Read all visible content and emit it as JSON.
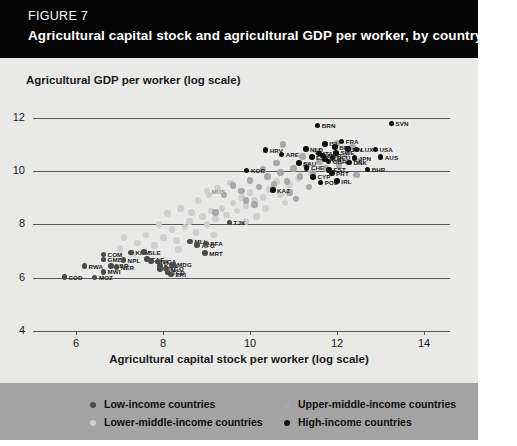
{
  "figure": {
    "number": "FIGURE 7",
    "title": "Agricultural capital stock and agricultural GDP per worker, by country"
  },
  "colors": {
    "header_bg": "#050505",
    "figure_bg": "#e9e9e7",
    "legend_bg": "#a3a3a3",
    "low_income": "#4a4a4a",
    "lower_middle_income": "#cfcfcf",
    "upper_middle_income": "#a8a8a8",
    "high_income": "#111111",
    "gridline": "#595959"
  },
  "legend": {
    "items": [
      {
        "label": "Low-income countries",
        "marker": "#4a4a4a"
      },
      {
        "label": "Lower-middle-income countries",
        "marker": "#cfcfcf"
      },
      {
        "label": "Upper-middle-income countries",
        "marker": "#a8a8a8"
      },
      {
        "label": "High-income countries",
        "marker": "#111111"
      }
    ]
  },
  "chart_data": {
    "type": "scatter",
    "title": "Agricultural capital stock and agricultural GDP per worker, by country",
    "xlabel": "Agricultural capital stock per worker (log scale)",
    "ylabel": "Agricultural GDP per worker (log scale)",
    "xlim": [
      5,
      14.6
    ],
    "ylim": [
      4,
      12.4
    ],
    "xticks": [
      6,
      8,
      10,
      12,
      14
    ],
    "yticks": [
      4,
      6,
      8,
      10,
      12
    ],
    "grid": true,
    "legend_position": "bottom",
    "series": [
      {
        "name": "Low-income countries",
        "color": "#4a4a4a",
        "points": [
          {
            "label": "COD",
            "x": 5.72,
            "y": 6.02
          },
          {
            "label": "MOZ",
            "x": 6.42,
            "y": 6.0
          },
          {
            "label": "RWA",
            "x": 6.18,
            "y": 6.43
          },
          {
            "label": "GMB",
            "x": 6.62,
            "y": 6.68
          },
          {
            "label": "COM",
            "x": 6.62,
            "y": 6.86
          },
          {
            "label": "LBR",
            "x": 6.8,
            "y": 6.44
          },
          {
            "label": "MWI",
            "x": 6.62,
            "y": 6.22
          },
          {
            "label": "NER",
            "x": 6.92,
            "y": 6.4
          },
          {
            "label": "KHM",
            "x": 7.26,
            "y": 6.95
          },
          {
            "label": "NPL",
            "x": 7.08,
            "y": 6.66
          },
          {
            "label": "SLE",
            "x": 7.56,
            "y": 6.96
          },
          {
            "label": "CAF",
            "x": 7.62,
            "y": 6.7
          },
          {
            "label": "ETH",
            "x": 7.72,
            "y": 6.62
          },
          {
            "label": "UGA",
            "x": 7.88,
            "y": 6.6
          },
          {
            "label": "KEN",
            "x": 7.92,
            "y": 6.46
          },
          {
            "label": "GIN",
            "x": 7.92,
            "y": 6.32
          },
          {
            "label": "TGO",
            "x": 8.06,
            "y": 6.34
          },
          {
            "label": "MDG",
            "x": 8.22,
            "y": 6.48
          },
          {
            "label": "TCD",
            "x": 8.1,
            "y": 6.2
          },
          {
            "label": "ERI",
            "x": 8.18,
            "y": 6.12
          },
          {
            "label": "MLI",
            "x": 8.62,
            "y": 7.36
          },
          {
            "label": "AFG",
            "x": 8.78,
            "y": 7.22
          },
          {
            "label": "BFA",
            "x": 8.98,
            "y": 7.28
          },
          {
            "label": "MRT",
            "x": 8.96,
            "y": 6.92
          },
          {
            "label": "TJK",
            "x": 9.52,
            "y": 8.06
          }
        ]
      },
      {
        "name": "Lower-middle-income countries",
        "color": "#cfcfcf",
        "points": [
          {
            "label": "",
            "x": 7.1,
            "y": 7.5
          },
          {
            "label": "",
            "x": 7.4,
            "y": 7.3
          },
          {
            "label": "",
            "x": 7.6,
            "y": 7.6
          },
          {
            "label": "",
            "x": 7.8,
            "y": 7.2
          },
          {
            "label": "",
            "x": 8.0,
            "y": 7.5
          },
          {
            "label": "",
            "x": 8.2,
            "y": 7.8
          },
          {
            "label": "",
            "x": 8.3,
            "y": 7.4
          },
          {
            "label": "",
            "x": 8.5,
            "y": 7.9
          },
          {
            "label": "",
            "x": 8.6,
            "y": 8.1
          },
          {
            "label": "",
            "x": 8.75,
            "y": 7.7
          },
          {
            "label": "",
            "x": 8.9,
            "y": 8.3
          },
          {
            "label": "",
            "x": 9.0,
            "y": 8.0
          },
          {
            "label": "",
            "x": 9.1,
            "y": 8.5
          },
          {
            "label": "",
            "x": 9.2,
            "y": 8.2
          },
          {
            "label": "",
            "x": 9.35,
            "y": 8.6
          },
          {
            "label": "",
            "x": 9.45,
            "y": 8.35
          },
          {
            "label": "",
            "x": 9.6,
            "y": 8.8
          },
          {
            "label": "",
            "x": 9.7,
            "y": 8.5
          },
          {
            "label": "",
            "x": 9.8,
            "y": 9.0
          },
          {
            "label": "",
            "x": 9.9,
            "y": 8.7
          },
          {
            "label": "",
            "x": 10.0,
            "y": 9.2
          },
          {
            "label": "",
            "x": 10.1,
            "y": 8.9
          },
          {
            "label": "",
            "x": 10.2,
            "y": 9.4
          },
          {
            "label": "",
            "x": 10.3,
            "y": 9.0
          },
          {
            "label": "",
            "x": 10.45,
            "y": 9.3
          },
          {
            "label": "",
            "x": 10.6,
            "y": 9.6
          },
          {
            "label": "",
            "x": 10.7,
            "y": 9.1
          },
          {
            "label": "",
            "x": 8.1,
            "y": 8.4
          },
          {
            "label": "",
            "x": 8.4,
            "y": 8.6
          },
          {
            "label": "",
            "x": 8.8,
            "y": 8.9
          },
          {
            "label": "",
            "x": 9.05,
            "y": 9.1
          },
          {
            "label": "",
            "x": 9.25,
            "y": 9.35
          },
          {
            "label": "",
            "x": 7.9,
            "y": 8.0
          },
          {
            "label": "",
            "x": 8.65,
            "y": 8.45
          },
          {
            "label": "",
            "x": 9.55,
            "y": 9.55
          },
          {
            "label": "",
            "x": 10.9,
            "y": 9.5
          },
          {
            "label": "",
            "x": 11.1,
            "y": 9.7
          },
          {
            "label": "",
            "x": 7.3,
            "y": 6.9
          },
          {
            "label": "",
            "x": 7.0,
            "y": 7.1
          },
          {
            "label": "",
            "x": 8.35,
            "y": 7.05
          },
          {
            "label": "",
            "x": 10.35,
            "y": 8.6
          },
          {
            "label": "",
            "x": 10.8,
            "y": 8.8
          },
          {
            "label": "",
            "x": 11.4,
            "y": 9.9
          },
          {
            "label": "",
            "x": 9.15,
            "y": 7.6
          },
          {
            "label": "",
            "x": 9.9,
            "y": 8.1
          },
          {
            "label": "",
            "x": 10.15,
            "y": 8.3
          },
          {
            "label": "MUS",
            "x": 9.0,
            "y": 9.25
          }
        ]
      },
      {
        "name": "Upper-middle-income countries",
        "color": "#a8a8a8",
        "points": [
          {
            "label": "",
            "x": 9.4,
            "y": 9.1
          },
          {
            "label": "",
            "x": 9.6,
            "y": 9.45
          },
          {
            "label": "",
            "x": 9.8,
            "y": 9.25
          },
          {
            "label": "",
            "x": 10.0,
            "y": 9.65
          },
          {
            "label": "",
            "x": 10.2,
            "y": 9.4
          },
          {
            "label": "",
            "x": 10.4,
            "y": 9.8
          },
          {
            "label": "",
            "x": 10.55,
            "y": 9.5
          },
          {
            "label": "",
            "x": 10.7,
            "y": 9.95
          },
          {
            "label": "",
            "x": 10.85,
            "y": 9.6
          },
          {
            "label": "",
            "x": 11.0,
            "y": 10.1
          },
          {
            "label": "",
            "x": 11.15,
            "y": 9.8
          },
          {
            "label": "",
            "x": 11.3,
            "y": 10.2
          },
          {
            "label": "",
            "x": 11.45,
            "y": 9.95
          },
          {
            "label": "",
            "x": 11.6,
            "y": 10.35
          },
          {
            "label": "",
            "x": 11.75,
            "y": 10.1
          },
          {
            "label": "",
            "x": 11.9,
            "y": 10.5
          },
          {
            "label": "",
            "x": 12.05,
            "y": 10.2
          },
          {
            "label": "",
            "x": 12.2,
            "y": 10.6
          },
          {
            "label": "",
            "x": 10.3,
            "y": 10.05
          },
          {
            "label": "",
            "x": 10.6,
            "y": 10.3
          },
          {
            "label": "",
            "x": 11.2,
            "y": 10.55
          },
          {
            "label": "",
            "x": 11.55,
            "y": 10.75
          },
          {
            "label": "",
            "x": 9.9,
            "y": 8.9
          },
          {
            "label": "",
            "x": 10.1,
            "y": 8.75
          },
          {
            "label": "",
            "x": 10.9,
            "y": 9.2
          },
          {
            "label": "",
            "x": 11.35,
            "y": 9.4
          },
          {
            "label": "",
            "x": 12.35,
            "y": 10.9
          },
          {
            "label": "",
            "x": 11.05,
            "y": 8.95
          },
          {
            "label": "",
            "x": 12.5,
            "y": 10.35
          },
          {
            "label": "",
            "x": 9.2,
            "y": 8.45
          },
          {
            "label": "",
            "x": 12.0,
            "y": 11.05
          },
          {
            "label": "",
            "x": 10.75,
            "y": 11.0
          },
          {
            "label": "",
            "x": 12.45,
            "y": 9.85
          }
        ]
      },
      {
        "name": "High-income countries",
        "color": "#111111",
        "points": [
          {
            "label": "SVN",
            "x": 13.25,
            "y": 11.78
          },
          {
            "label": "BRN",
            "x": 11.55,
            "y": 11.7
          },
          {
            "label": "FRA",
            "x": 12.1,
            "y": 11.1
          },
          {
            "label": "NLD",
            "x": 11.28,
            "y": 10.82
          },
          {
            "label": "ISL",
            "x": 11.72,
            "y": 11.02
          },
          {
            "label": "BEL",
            "x": 11.95,
            "y": 10.9
          },
          {
            "label": "FIN",
            "x": 12.25,
            "y": 10.82
          },
          {
            "label": "LUX",
            "x": 12.45,
            "y": 10.8
          },
          {
            "label": "USA",
            "x": 12.88,
            "y": 10.8
          },
          {
            "label": "AUS",
            "x": 13.0,
            "y": 10.52
          },
          {
            "label": "ITA",
            "x": 11.58,
            "y": 10.66
          },
          {
            "label": "ESP",
            "x": 11.42,
            "y": 10.52
          },
          {
            "label": "SWE",
            "x": 11.98,
            "y": 10.68
          },
          {
            "label": "DEU",
            "x": 11.9,
            "y": 10.5
          },
          {
            "label": "GBR",
            "x": 11.8,
            "y": 10.36
          },
          {
            "label": "JPN",
            "x": 12.4,
            "y": 10.48
          },
          {
            "label": "DNK",
            "x": 12.28,
            "y": 10.32
          },
          {
            "label": "AUT",
            "x": 11.72,
            "y": 10.44
          },
          {
            "label": "NOR",
            "x": 11.68,
            "y": 10.58
          },
          {
            "label": "HRV",
            "x": 10.35,
            "y": 10.78
          },
          {
            "label": "ARE",
            "x": 10.72,
            "y": 10.62
          },
          {
            "label": "SAU",
            "x": 11.12,
            "y": 10.3
          },
          {
            "label": "CHE",
            "x": 11.3,
            "y": 10.12
          },
          {
            "label": "EST",
            "x": 11.82,
            "y": 10.04
          },
          {
            "label": "PRT",
            "x": 11.88,
            "y": 9.92
          },
          {
            "label": "IRL",
            "x": 12.0,
            "y": 9.62
          },
          {
            "label": "KOR",
            "x": 9.92,
            "y": 10.02
          },
          {
            "label": "POL",
            "x": 11.62,
            "y": 9.56
          },
          {
            "label": "KAZ",
            "x": 10.52,
            "y": 9.28
          },
          {
            "label": "BHR",
            "x": 12.7,
            "y": 10.05
          },
          {
            "label": "CYP",
            "x": 11.45,
            "y": 9.78
          }
        ]
      }
    ]
  }
}
